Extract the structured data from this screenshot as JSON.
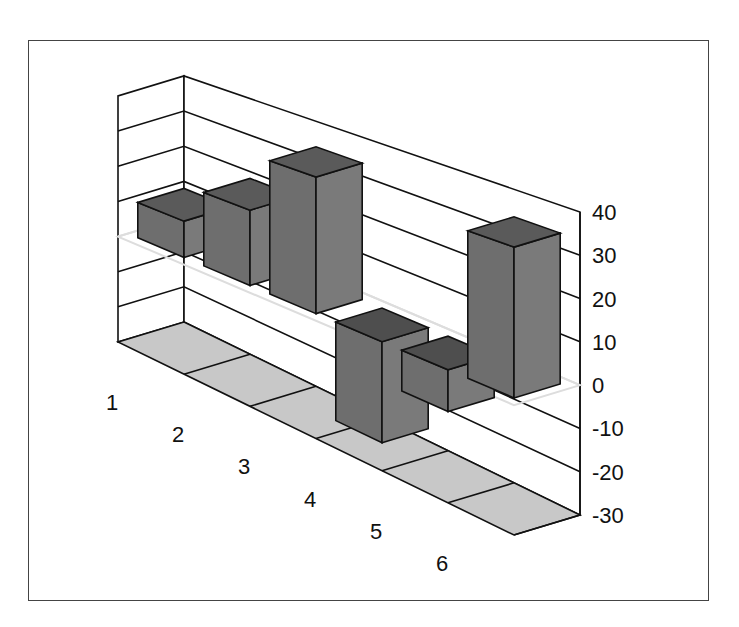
{
  "chart_data": {
    "type": "bar",
    "style": "3d-column",
    "title": "",
    "xlabel": "",
    "ylabel": "",
    "categories": [
      "1",
      "2",
      "3",
      "4",
      "5",
      "6"
    ],
    "values": [
      10,
      20,
      35,
      -25,
      -10,
      35
    ],
    "ylim": [
      -30,
      40
    ],
    "yticks": [
      40,
      30,
      20,
      10,
      0,
      -10,
      -20,
      -30
    ],
    "ytick_labels": [
      "40",
      "30",
      "20",
      "10",
      "0",
      "-10",
      "-20",
      "-30"
    ],
    "grid": true,
    "legend": null,
    "colors": {
      "bar_front": "#6e6e6e",
      "bar_side": "#7a7a7a",
      "bar_top": "#5a5a5a",
      "floor": "#c8c8c8",
      "grid": "#111111",
      "zero_plane": "#dddddd"
    }
  }
}
